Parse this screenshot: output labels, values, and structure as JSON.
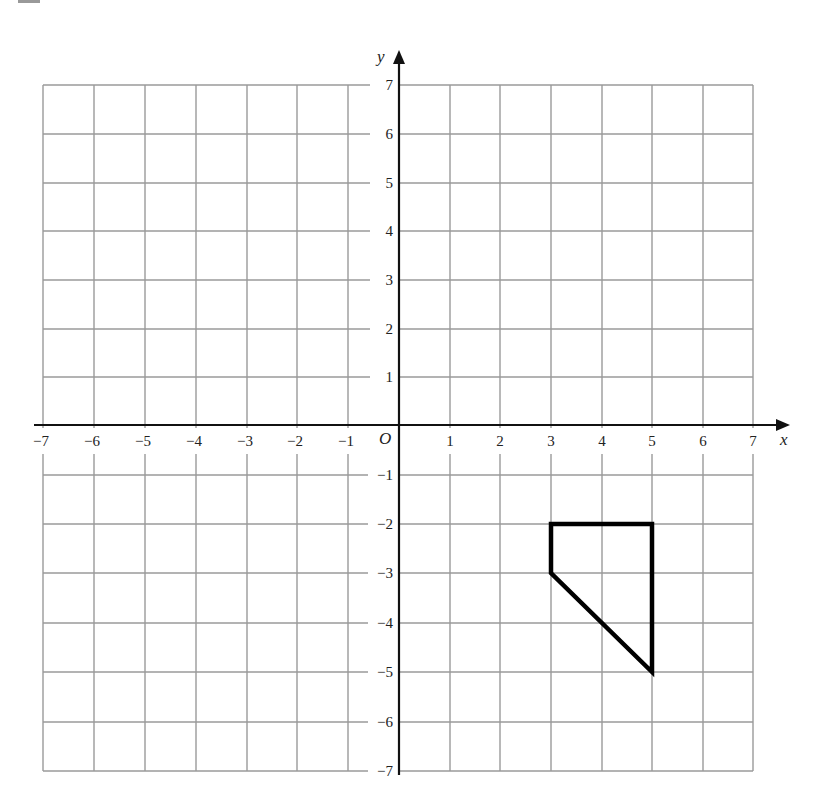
{
  "diagram": {
    "type": "coordinate-grid",
    "x_axis": {
      "label": "x",
      "min": -7,
      "max": 7,
      "ticks": [
        -7,
        -6,
        -5,
        -4,
        -3,
        -2,
        -1,
        1,
        2,
        3,
        4,
        5,
        6,
        7
      ]
    },
    "y_axis": {
      "label": "y",
      "min": -7,
      "max": 7,
      "ticks": [
        7,
        6,
        5,
        4,
        3,
        2,
        1,
        -1,
        -2,
        -3,
        -4,
        -5,
        -6,
        -7
      ]
    },
    "origin_label": "O",
    "grid": {
      "visible": true,
      "step": 1,
      "color": "#9a9a9a"
    },
    "axis_color": "#111111",
    "shape": {
      "name": "quadrilateral",
      "vertices": [
        [
          3,
          -2
        ],
        [
          5,
          -2
        ],
        [
          5,
          -5
        ],
        [
          3,
          -3
        ]
      ],
      "stroke": "#000000"
    }
  },
  "labels": {
    "x": "x",
    "y": "y",
    "origin": "O",
    "xt": {
      "n7": "−7",
      "n6": "−6",
      "n5": "−5",
      "n4": "−4",
      "n3": "−3",
      "n2": "−2",
      "n1": "−1",
      "p1": "1",
      "p2": "2",
      "p3": "3",
      "p4": "4",
      "p5": "5",
      "p6": "6",
      "p7": "7"
    },
    "yt": {
      "p7": "7",
      "p6": "6",
      "p5": "5",
      "p4": "4",
      "p3": "3",
      "p2": "2",
      "p1": "1",
      "n1": "−1",
      "n2": "−2",
      "n3": "−3",
      "n4": "−4",
      "n5": "−5",
      "n6": "−6",
      "n7": "−7"
    }
  }
}
